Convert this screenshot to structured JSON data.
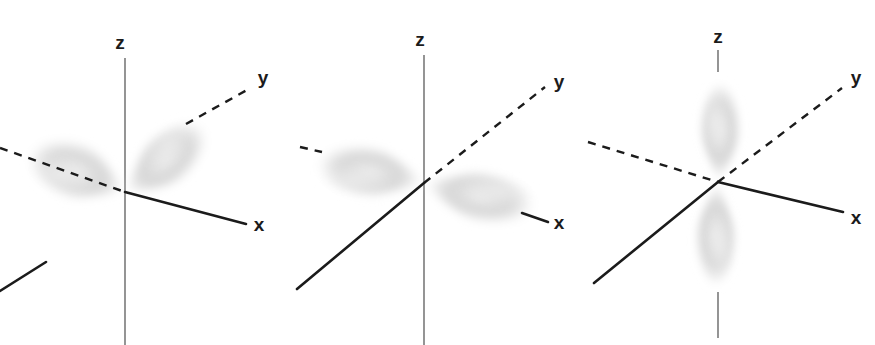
{
  "figure": {
    "title": "",
    "background_color": "#ffffff",
    "width": 875,
    "height": 345,
    "ink_color": "#1b1b1b",
    "axis_solid_color": "#1b1b1b",
    "axis_dashed_color": "#1b1b1b",
    "axis_thin_color": "#6e6e6e",
    "lobe_color": "#c9c9c9",
    "lobe_highlight_color": "#ebebeb"
  },
  "orbitals": [
    {
      "id": "p-y",
      "name": "py orbital",
      "origin": {
        "x": 125,
        "y": 192
      },
      "lobe_axis": "y",
      "lobe_orientation": "diagonal-up-right",
      "axes": [
        {
          "name": "z",
          "label": "z",
          "style": "thin-solid",
          "label_x": 120,
          "label_y": 44
        },
        {
          "name": "y",
          "label": "y",
          "style": "dashed",
          "label_x": 263,
          "label_y": 78
        },
        {
          "name": "x",
          "label": "x",
          "style": "solid",
          "label_x": 258,
          "label_y": 225
        }
      ],
      "lobes": [
        {
          "position": "upper-right",
          "cx": 178,
          "cy": 148
        },
        {
          "position": "lower-left",
          "cx": 72,
          "cy": 236
        }
      ]
    },
    {
      "id": "p-x",
      "name": "px orbital",
      "origin": {
        "x": 424,
        "y": 183
      },
      "lobe_axis": "x",
      "lobe_orientation": "horizontal",
      "axes": [
        {
          "name": "z",
          "label": "z",
          "style": "thin-solid",
          "label_x": 420,
          "label_y": 41
        },
        {
          "name": "y",
          "label": "y",
          "style": "dashed",
          "label_x": 559,
          "label_y": 82
        },
        {
          "name": "x",
          "label": "x",
          "style": "solid",
          "label_x": 558,
          "label_y": 223
        }
      ],
      "lobes": [
        {
          "position": "left",
          "cx": 354,
          "cy": 170
        },
        {
          "position": "right",
          "cx": 495,
          "cy": 196
        }
      ]
    },
    {
      "id": "p-z",
      "name": "pz orbital",
      "origin": {
        "x": 718,
        "y": 182
      },
      "lobe_axis": "z",
      "lobe_orientation": "vertical",
      "axes": [
        {
          "name": "z",
          "label": "z",
          "style": "thin-solid",
          "label_x": 718,
          "label_y": 38
        },
        {
          "name": "y",
          "label": "y",
          "style": "dashed",
          "label_x": 856,
          "label_y": 78
        },
        {
          "name": "x",
          "label": "x",
          "style": "solid",
          "label_x": 856,
          "label_y": 218
        }
      ],
      "lobes": [
        {
          "position": "top",
          "cx": 718,
          "cy": 116
        },
        {
          "position": "bottom",
          "cx": 718,
          "cy": 250
        }
      ]
    }
  ]
}
